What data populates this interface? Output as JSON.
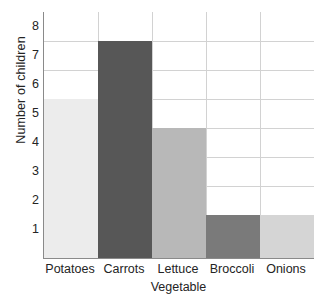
{
  "chart_data": {
    "type": "bar",
    "title": "",
    "xlabel": "Vegetable",
    "ylabel": "Number of children",
    "categories": [
      "Potatoes",
      "Carrots",
      "Lettuce",
      "Broccoli",
      "Onions"
    ],
    "values": [
      5.5,
      7.5,
      4.5,
      1.5,
      1.5
    ],
    "ylim": [
      0,
      8.5
    ],
    "yticks": [
      1,
      2,
      3,
      4,
      5,
      6,
      7,
      8
    ],
    "ytick_labels": [
      "1",
      "2",
      "3",
      "4",
      "5",
      "6",
      "7",
      "8"
    ],
    "gridlines": [
      1.5,
      2.5,
      3.5,
      4.5,
      5.5,
      6.5,
      7.5
    ],
    "grid": true,
    "legend": "none",
    "bar_colors": [
      "#ececec",
      "#575757",
      "#b8b8b8",
      "#7a7a7a",
      "#d5d5d5"
    ],
    "series": [
      {
        "name": "Number of children",
        "values": [
          5.5,
          7.5,
          4.5,
          1.5,
          1.5
        ]
      }
    ],
    "points": [
      {
        "category": "Potatoes",
        "value": 5.5,
        "color": "#ececec"
      },
      {
        "category": "Carrots",
        "value": 7.5,
        "color": "#575757"
      },
      {
        "category": "Lettuce",
        "value": 4.5,
        "color": "#b8b8b8"
      },
      {
        "category": "Broccoli",
        "value": 1.5,
        "color": "#7a7a7a"
      },
      {
        "category": "Onions",
        "value": 1.5,
        "color": "#d5d5d5"
      }
    ]
  },
  "axes": {
    "axis_color": "#8a8a8a",
    "grid_color": "#d2d2d2",
    "background": "#ffffff"
  }
}
